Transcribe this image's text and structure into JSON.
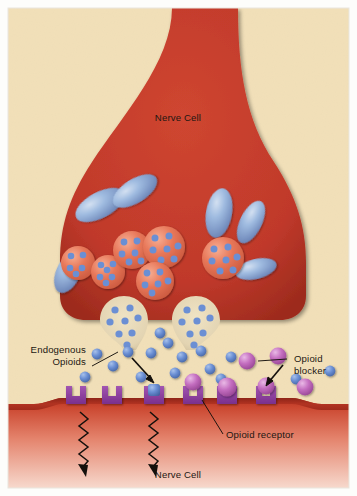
{
  "figure": {
    "background_color": "#f2e0b8",
    "border_color": "#fdfdfb"
  },
  "labels": {
    "presynaptic_cell": "Nerve Cell",
    "postsynaptic_cell": "Nerve Cell",
    "endogenous_opioids_line1": "Endogenous",
    "endogenous_opioids_line2": "Opioids",
    "opioid_blocker_line1": "Opioid",
    "opioid_blocker_line2": "blocker",
    "opioid_receptor": "Opioid receptor"
  },
  "colors": {
    "cell_red": "#c0392b",
    "cell_red_dark": "#a52a1e",
    "cell_red_light": "#e06a52",
    "cleft_cream": "#f2e0b8",
    "vesicle_coral": "#e8785a",
    "vesicle_coral_light": "#f39b7f",
    "opioid_blue": "#6b8fd4",
    "opioid_blue_dark": "#4a6bb0",
    "mitochondria_blue": "#7e9ccd",
    "mitochondria_blue_light": "#aac3e4",
    "receptor_purple": "#8e3f9e",
    "blocker_pink": "#c46ec0",
    "blocker_pink_light": "#dda3dc",
    "ink": "#1c1712"
  },
  "structures": {
    "mitochondria": [
      {
        "cx": 100,
        "cy": 205,
        "rx": 26,
        "ry": 13,
        "rot": -28
      },
      {
        "cx": 133,
        "cy": 192,
        "rx": 24,
        "ry": 12,
        "rot": -33
      },
      {
        "cx": 219,
        "cy": 214,
        "rx": 13,
        "ry": 24,
        "rot": 12
      },
      {
        "cx": 250,
        "cy": 222,
        "rx": 11,
        "ry": 22,
        "rot": 25
      },
      {
        "cx": 255,
        "cy": 268,
        "rx": 20,
        "ry": 10,
        "rot": -12
      },
      {
        "cx": 68,
        "cy": 272,
        "rx": 12,
        "ry": 21,
        "rot": 22
      }
    ],
    "vesicles": [
      {
        "cx": 78,
        "cy": 262,
        "r": 17
      },
      {
        "cx": 107,
        "cy": 272,
        "r": 17
      },
      {
        "cx": 131,
        "cy": 250,
        "r": 19
      },
      {
        "cx": 163,
        "cy": 248,
        "r": 21
      },
      {
        "cx": 154,
        "cy": 281,
        "r": 19
      },
      {
        "cx": 222,
        "cy": 258,
        "r": 21
      }
    ],
    "fusing_vesicles": [
      {
        "cx": 124,
        "cy": 318,
        "r": 21,
        "neckx": 130,
        "necky": 348
      },
      {
        "cx": 196,
        "cy": 318,
        "r": 21,
        "neckx": 192,
        "necky": 348
      }
    ],
    "receptors": [
      {
        "x": 70,
        "y": 392,
        "bound": "none"
      },
      {
        "x": 106,
        "y": 392,
        "bound": "none"
      },
      {
        "x": 148,
        "y": 392,
        "bound": "opioid"
      },
      {
        "x": 187,
        "y": 392,
        "bound": "none"
      },
      {
        "x": 221,
        "y": 392,
        "bound": "blocker"
      },
      {
        "x": 260,
        "y": 392,
        "bound": "none"
      }
    ],
    "free_opioids": [
      {
        "cx": 128,
        "cy": 350
      },
      {
        "cx": 96,
        "cy": 352
      },
      {
        "cx": 112,
        "cy": 364
      },
      {
        "cx": 150,
        "cy": 352
      },
      {
        "cx": 167,
        "cy": 342
      },
      {
        "cx": 180,
        "cy": 356
      },
      {
        "cx": 200,
        "cy": 350
      },
      {
        "cx": 140,
        "cy": 376
      },
      {
        "cx": 174,
        "cy": 372
      },
      {
        "cx": 209,
        "cy": 368
      },
      {
        "cx": 220,
        "cy": 378
      },
      {
        "cx": 296,
        "cy": 378
      },
      {
        "cx": 330,
        "cy": 370
      },
      {
        "cx": 84,
        "cy": 376
      },
      {
        "cx": 196,
        "cy": 335
      }
    ],
    "free_blockers": [
      {
        "cx": 247,
        "cy": 360
      },
      {
        "cx": 277,
        "cy": 355
      },
      {
        "cx": 196,
        "cy": 383
      },
      {
        "cx": 305,
        "cy": 386
      },
      {
        "cx": 233,
        "cy": 388
      }
    ],
    "signal_arrows": [
      {
        "x": 86,
        "y0": 412,
        "y1": 476
      },
      {
        "x": 156,
        "y0": 412,
        "y1": 476
      }
    ]
  },
  "annotations": {
    "endogenous_leader": "line from Endogenous Opioids label to a blue opioid molecule",
    "blocker_leader": "line from Opioid blocker label to a pink blocker molecule",
    "receptor_leader": "line from Opioid receptor label to a receptor on the membrane",
    "binding_arrow_opioid": "arrow showing opioid docking into receptor",
    "binding_arrow_blocker": "arrow showing blocker docking into receptor"
  }
}
